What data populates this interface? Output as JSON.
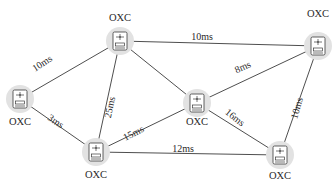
{
  "diagram": {
    "type": "network-topology",
    "nodes": [
      {
        "id": "n1",
        "label": "OXC",
        "icon": "optical-cross-connect-icon"
      },
      {
        "id": "n2",
        "label": "OXC",
        "icon": "optical-cross-connect-icon"
      },
      {
        "id": "n3",
        "label": "OXC",
        "icon": "optical-cross-connect-icon"
      },
      {
        "id": "n4",
        "label": "OXC",
        "icon": "optical-cross-connect-icon"
      },
      {
        "id": "n5",
        "label": "OXC",
        "icon": "optical-cross-connect-icon"
      },
      {
        "id": "n6",
        "label": "OXC",
        "icon": "optical-cross-connect-icon"
      }
    ],
    "edges": [
      {
        "from": "n1",
        "to": "n2",
        "label": "10ms"
      },
      {
        "from": "n1",
        "to": "n5",
        "label": "3ms"
      },
      {
        "from": "n2",
        "to": "n3",
        "label": "10ms"
      },
      {
        "from": "n2",
        "to": "n5",
        "label": "25ms"
      },
      {
        "from": "n2",
        "to": "n4",
        "label": ""
      },
      {
        "from": "n4",
        "to": "n3",
        "label": "8ms"
      },
      {
        "from": "n4",
        "to": "n5",
        "label": "15ms"
      },
      {
        "from": "n4",
        "to": "n6",
        "label": "16ms"
      },
      {
        "from": "n5",
        "to": "n6",
        "label": "12ms"
      },
      {
        "from": "n3",
        "to": "n6",
        "label": "10ms"
      }
    ]
  }
}
